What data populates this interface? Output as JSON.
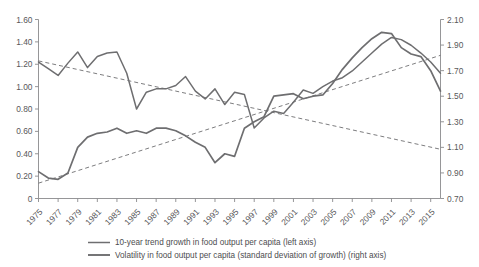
{
  "chart_data": {
    "type": "line",
    "title": "",
    "subtitle": "",
    "xlabel": "",
    "ylabel": "",
    "grid": false,
    "legend_position": "bottom",
    "x": [
      1975,
      1976,
      1977,
      1978,
      1979,
      1980,
      1981,
      1982,
      1983,
      1984,
      1985,
      1986,
      1987,
      1988,
      1989,
      1990,
      1991,
      1992,
      1993,
      1994,
      1995,
      1996,
      1997,
      1998,
      1999,
      2000,
      2001,
      2002,
      2003,
      2004,
      2005,
      2006,
      2007,
      2008,
      2009,
      2010,
      2011,
      2012,
      2013,
      2014,
      2015,
      2016
    ],
    "xtick_labels": [
      "1975",
      "1977",
      "1979",
      "1981",
      "1983",
      "1985",
      "1987",
      "1989",
      "1991",
      "1993",
      "1995",
      "1997",
      "1999",
      "2001",
      "2003",
      "2005",
      "2007",
      "2009",
      "2011",
      "2013",
      "2015"
    ],
    "left_axis": {
      "ticks": [
        "0",
        "0.20",
        "0.40",
        "0.60",
        "0.80",
        "1.00",
        "1.20",
        "1.40",
        "1.60"
      ],
      "tick_values": [
        0,
        0.2,
        0.4,
        0.6,
        0.8,
        1.0,
        1.2,
        1.4,
        1.6
      ],
      "ylim": [
        0,
        1.6
      ]
    },
    "right_axis": {
      "ticks": [
        "0.70",
        "0.90",
        "1.10",
        "1.30",
        "1.50",
        "1.70",
        "1.90",
        "2.10"
      ],
      "tick_values": [
        0.7,
        0.9,
        1.1,
        1.3,
        1.5,
        1.7,
        1.9,
        2.1
      ],
      "ylim": [
        0.7,
        2.1
      ]
    },
    "series": [
      {
        "name": "10-year trend growth in food output per capita (left axis)",
        "axis": "left",
        "style": "solid",
        "color": "#6e6e70",
        "values": [
          1.22,
          1.16,
          1.1,
          1.21,
          1.31,
          1.17,
          1.27,
          1.3,
          1.31,
          1.12,
          0.8,
          0.95,
          0.98,
          0.98,
          1.01,
          1.09,
          0.96,
          0.89,
          0.98,
          0.84,
          0.95,
          0.93,
          0.63,
          0.72,
          0.78,
          0.76,
          0.86,
          0.97,
          0.94,
          1.0,
          1.05,
          1.08,
          1.14,
          1.22,
          1.3,
          1.38,
          1.44,
          1.42,
          1.37,
          1.3,
          1.22,
          1.12
        ]
      },
      {
        "name": "Volatility in food output per capita (standard deviation of growth) (right axis)",
        "axis": "right",
        "style": "solid",
        "color": "#6e6e70",
        "values": [
          0.91,
          0.86,
          0.85,
          0.9,
          1.1,
          1.18,
          1.21,
          1.22,
          1.25,
          1.21,
          1.23,
          1.21,
          1.25,
          1.25,
          1.23,
          1.19,
          1.14,
          1.1,
          0.98,
          1.05,
          1.03,
          1.25,
          1.3,
          1.34,
          1.5,
          1.51,
          1.52,
          1.48,
          1.5,
          1.51,
          1.6,
          1.71,
          1.8,
          1.88,
          1.95,
          2.0,
          1.99,
          1.88,
          1.83,
          1.81,
          1.7,
          1.54
        ]
      }
    ],
    "trend_lines": [
      {
        "name": "trend-growth-dashed-trend",
        "axis": "left",
        "style": "dashed",
        "from": [
          1975,
          1.23
        ],
        "to": [
          2016,
          0.44
        ]
      },
      {
        "name": "volatility-dashed-trend",
        "axis": "right",
        "style": "dashed",
        "from": [
          1975,
          0.82
        ],
        "to": [
          2016,
          1.82
        ]
      }
    ],
    "legend": [
      {
        "label": "10-year trend growth in food output per capita (left axis)",
        "swatch": "thin-gray-line"
      },
      {
        "label": "Volatility in food output per capita (standard deviation of growth) (right axis)",
        "swatch": "thick-gray-line"
      }
    ],
    "colors": {
      "line": "#6e6e70",
      "axis": "#8a8a8c",
      "text": "#58585a"
    }
  }
}
